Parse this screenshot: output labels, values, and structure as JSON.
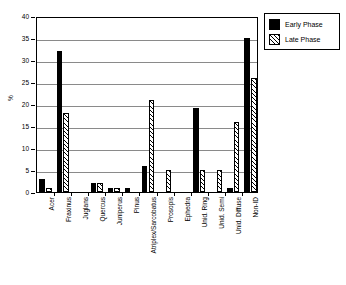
{
  "chart_data": {
    "type": "bar",
    "title": "",
    "xlabel": "",
    "ylabel": "%",
    "ylim": [
      0,
      40
    ],
    "yticks": [
      0,
      5,
      10,
      15,
      20,
      25,
      30,
      35,
      40
    ],
    "grid": true,
    "legend_position": "top-right",
    "categories": [
      "Acer",
      "Fraxinus",
      "Juglans",
      "Quercus",
      "Juniperus",
      "Pinus",
      "Atriplex/Sarcobatus",
      "Prosopis",
      "Ephedra",
      "Unid. Ring",
      "Unid. Semi",
      "Unid. Diffuse",
      "Non-ID"
    ],
    "series": [
      {
        "name": "Early Phase",
        "fill": "solid-black",
        "color": "#000000",
        "values": [
          3,
          32,
          0,
          2,
          1,
          1,
          6,
          0,
          0,
          19,
          0,
          1,
          35
        ]
      },
      {
        "name": "Late Phase",
        "fill": "diagonal-hatch",
        "color": "#000000",
        "values": [
          1,
          18,
          0,
          2,
          1,
          0,
          21,
          5,
          0,
          5,
          5,
          16,
          26
        ]
      }
    ]
  },
  "legend": {
    "items": [
      {
        "label": "Early Phase"
      },
      {
        "label": "Late Phase"
      }
    ]
  },
  "axes": {
    "y_title": "%"
  }
}
